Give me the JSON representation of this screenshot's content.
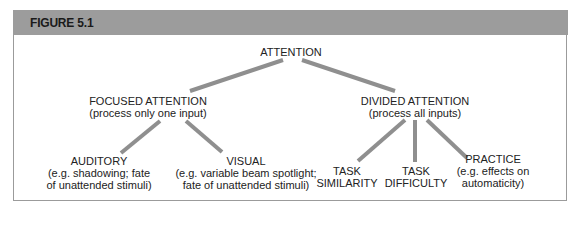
{
  "figure": {
    "label": "FIGURE 5.1"
  },
  "colors": {
    "header_bg": "#9c9c9c",
    "border": "#9b9b9b",
    "link": "#8a8a8a",
    "text": "#222222"
  },
  "tree": {
    "root": {
      "title": "ATTENTION"
    },
    "focused": {
      "title": "FOCUSED ATTENTION",
      "subtitle": "(process only one input)",
      "children": [
        {
          "title": "AUDITORY",
          "line1": "(e.g. shadowing; fate",
          "line2": "of unattended stimuli)"
        },
        {
          "title": "VISUAL",
          "line1": "(e.g. variable beam spotlight;",
          "line2": "fate of unattended stimuli)"
        }
      ]
    },
    "divided": {
      "title": "DIVIDED ATTENTION",
      "subtitle": "(process all inputs)",
      "children": [
        {
          "line1": "TASK",
          "line2": "SIMILARITY"
        },
        {
          "line1": "TASK",
          "line2": "DIFFICULTY"
        },
        {
          "title": "PRACTICE",
          "line1": "(e.g. effects on",
          "line2": "automaticity)"
        }
      ]
    }
  }
}
